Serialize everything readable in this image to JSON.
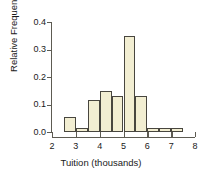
{
  "chart_data": {
    "type": "bar",
    "title": "",
    "subtitle": "",
    "xlabel": "Tuition (thousands)",
    "ylabel": "Relative Frequency",
    "xlim": [
      2,
      8
    ],
    "ylim": [
      0.0,
      0.4
    ],
    "grid": false,
    "legend": null,
    "bin_width": 0.5,
    "xticks": [
      2,
      3,
      4,
      5,
      6,
      7,
      8
    ],
    "xtick_labels": [
      "2",
      "3",
      "4",
      "5",
      "6",
      "7",
      "8"
    ],
    "yticks": [
      0.0,
      0.1,
      0.2,
      0.3,
      0.4
    ],
    "ytick_labels": [
      "0.0",
      "0.1",
      "0.2",
      "0.3",
      "0.4"
    ],
    "bin_edges": [
      2.5,
      3.0,
      3.5,
      4.0,
      4.5,
      5.0,
      5.5,
      6.0,
      6.5,
      7.0,
      7.5
    ],
    "categories": [
      "2.5-3.0",
      "3.0-3.5",
      "3.5-4.0",
      "4.0-4.5",
      "4.5-5.0",
      "5.0-5.5",
      "5.5-6.0",
      "6.0-6.5",
      "6.5-7.0",
      "7.0-7.5"
    ],
    "values": [
      0.055,
      0.015,
      0.115,
      0.15,
      0.13,
      0.35,
      0.13,
      0.015,
      0.015,
      0.015
    ],
    "bar_fill_color": "#f2eed2",
    "bar_edge_color": "#48463f",
    "axis_color": "#5d5b52",
    "background_color": "#ffffff"
  }
}
